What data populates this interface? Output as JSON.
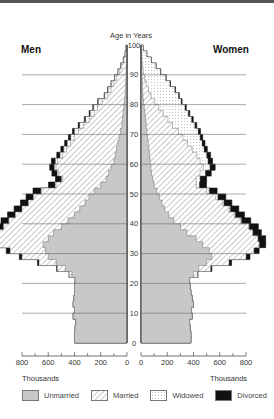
{
  "chart_data": {
    "type": "bar",
    "subtype": "population-pyramid-stacked",
    "title": "Age in Years",
    "left_label": "Men",
    "right_label": "Women",
    "xlabel": "Thousands",
    "ylabel": "Age in Years",
    "x_ticks": [
      800,
      600,
      400,
      200,
      0
    ],
    "x_ticks_right": [
      0,
      200,
      400,
      600,
      800
    ],
    "y_ticks": [
      0,
      10,
      20,
      30,
      40,
      50,
      60,
      70,
      80,
      90,
      100
    ],
    "xlim": [
      0,
      800
    ],
    "ylim": [
      0,
      100
    ],
    "legend": [
      "Unmarried",
      "Married",
      "Widowed",
      "Divorced"
    ],
    "colors": {
      "Unmarried": "#c8c8c8",
      "Married": "#ffffff",
      "Widowed": "#ffffff",
      "Divorced": "#111111"
    },
    "ages": [
      0,
      2,
      4,
      6,
      8,
      10,
      12,
      14,
      16,
      18,
      20,
      22,
      24,
      26,
      28,
      30,
      32,
      34,
      36,
      38,
      40,
      42,
      44,
      46,
      48,
      50,
      52,
      54,
      56,
      58,
      60,
      62,
      64,
      66,
      68,
      70,
      72,
      74,
      76,
      78,
      80,
      82,
      84,
      86,
      88,
      90,
      92,
      94,
      96,
      98,
      100
    ],
    "men": {
      "unmarried": [
        400,
        400,
        395,
        390,
        410,
        400,
        410,
        405,
        400,
        400,
        395,
        420,
        470,
        540,
        600,
        620,
        640,
        600,
        560,
        500,
        450,
        400,
        360,
        320,
        290,
        250,
        200,
        160,
        140,
        120,
        100,
        90,
        80,
        70,
        60,
        50,
        40,
        35,
        30,
        25,
        20,
        15,
        12,
        10,
        8,
        6,
        5,
        3,
        2,
        1,
        0
      ],
      "married": [
        0,
        0,
        0,
        0,
        0,
        0,
        0,
        0,
        0,
        0,
        0,
        20,
        60,
        130,
        200,
        270,
        340,
        380,
        420,
        440,
        450,
        450,
        440,
        430,
        420,
        400,
        340,
        330,
        380,
        420,
        430,
        400,
        380,
        360,
        340,
        320,
        290,
        250,
        220,
        200,
        170,
        130,
        110,
        90,
        70,
        50,
        35,
        20,
        10,
        5,
        0
      ],
      "widowed": [
        0,
        0,
        0,
        0,
        0,
        0,
        0,
        0,
        0,
        0,
        0,
        0,
        0,
        0,
        0,
        0,
        0,
        0,
        0,
        0,
        0,
        0,
        0,
        2,
        4,
        6,
        8,
        10,
        12,
        14,
        16,
        20,
        22,
        25,
        28,
        30,
        30,
        30,
        30,
        30,
        28,
        25,
        22,
        20,
        16,
        12,
        8,
        5,
        3,
        1,
        0
      ],
      "divorced": [
        0,
        0,
        0,
        0,
        0,
        0,
        0,
        0,
        0,
        0,
        0,
        2,
        6,
        12,
        20,
        30,
        40,
        50,
        55,
        60,
        60,
        60,
        60,
        60,
        55,
        60,
        50,
        45,
        40,
        35,
        30,
        25,
        22,
        20,
        18,
        15,
        12,
        10,
        8,
        6,
        5,
        4,
        3,
        2,
        1,
        1,
        0,
        0,
        0,
        0,
        0
      ]
    },
    "women": {
      "unmarried": [
        380,
        380,
        375,
        370,
        390,
        385,
        400,
        390,
        380,
        375,
        370,
        400,
        440,
        500,
        540,
        520,
        470,
        420,
        350,
        300,
        250,
        210,
        180,
        160,
        140,
        120,
        100,
        90,
        80,
        75,
        70,
        65,
        60,
        55,
        50,
        45,
        40,
        35,
        30,
        25,
        20,
        15,
        12,
        10,
        8,
        6,
        5,
        3,
        2,
        1,
        0
      ],
      "married": [
        0,
        0,
        0,
        0,
        0,
        0,
        0,
        0,
        0,
        0,
        0,
        30,
        90,
        170,
        260,
        340,
        430,
        470,
        500,
        520,
        510,
        500,
        490,
        460,
        430,
        380,
        320,
        330,
        370,
        400,
        380,
        360,
        330,
        300,
        270,
        240,
        200,
        170,
        140,
        110,
        85,
        60,
        45,
        30,
        20,
        12,
        8,
        4,
        2,
        1,
        0
      ],
      "widowed": [
        0,
        0,
        0,
        0,
        0,
        0,
        0,
        0,
        0,
        0,
        0,
        0,
        0,
        0,
        0,
        0,
        0,
        0,
        2,
        4,
        6,
        8,
        10,
        12,
        16,
        20,
        24,
        30,
        40,
        50,
        60,
        75,
        90,
        110,
        130,
        150,
        170,
        180,
        190,
        200,
        200,
        210,
        200,
        180,
        160,
        130,
        100,
        70,
        40,
        15,
        0
      ],
      "divorced": [
        0,
        0,
        0,
        0,
        0,
        0,
        0,
        0,
        0,
        0,
        0,
        4,
        10,
        20,
        30,
        40,
        50,
        60,
        65,
        70,
        70,
        70,
        65,
        60,
        60,
        60,
        55,
        50,
        45,
        40,
        35,
        30,
        25,
        22,
        20,
        18,
        15,
        13,
        12,
        10,
        8,
        7,
        6,
        5,
        4,
        3,
        2,
        1,
        1,
        0,
        0
      ]
    }
  },
  "labels": {
    "title": "Age in Years",
    "men": "Men",
    "women": "Women",
    "thousands_left": "Thousands",
    "thousands_right": "Thousands"
  },
  "legend": [
    {
      "label": "Unmarried"
    },
    {
      "label": "Married"
    },
    {
      "label": "Widowed"
    },
    {
      "label": "Divorced"
    }
  ]
}
